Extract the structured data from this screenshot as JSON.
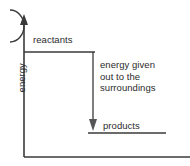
{
  "figure": {
    "type": "energy-level-diagram",
    "reaction_type": "exothermic",
    "part_marker": ")",
    "axes": {
      "y_label": "energy",
      "y_axis_arrow": "up",
      "x_axis_label": ""
    },
    "levels": [
      {
        "id": "reactants",
        "label": "reactants",
        "relative_energy": "high"
      },
      {
        "id": "products",
        "label": "products",
        "relative_energy": "low"
      }
    ],
    "annotation": {
      "arrow_direction": "down",
      "lines": [
        "energy given",
        "out to the",
        "surroundings"
      ],
      "full_text": "energy given out to the surroundings"
    },
    "colors": {
      "stroke": "#3a3a3a",
      "text": "#2b2b2b",
      "background": "#ffffff"
    }
  }
}
